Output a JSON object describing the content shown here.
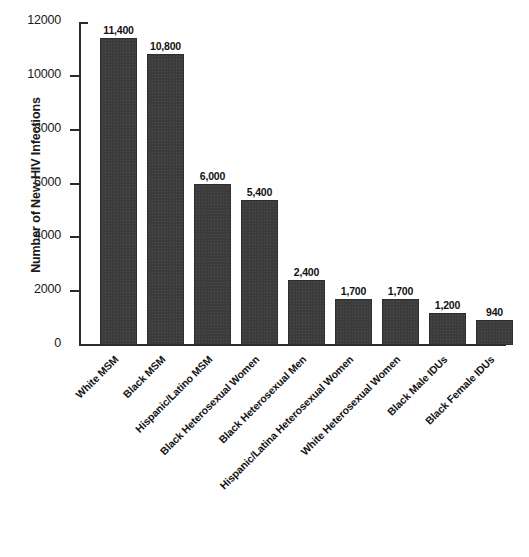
{
  "chart_data": {
    "type": "bar",
    "title": "",
    "xlabel": "",
    "ylabel": "Number of New HIV Infections",
    "ylim": [
      0,
      12000
    ],
    "grid": false,
    "legend": "none",
    "bar_color": "#3c3c3c",
    "axis_color": "#2b2b2b",
    "background_color": "#ffffff",
    "yticks": [
      0,
      2000,
      4000,
      6000,
      8000,
      10000,
      12000
    ],
    "ytick_labels": [
      "0",
      "2000",
      "4000",
      "6000",
      "8000",
      "10000",
      "12000"
    ],
    "categories": [
      "White MSM",
      "Black MSM",
      "Hispanic/Latino MSM",
      "Black Heterosexual Women",
      "Black Heterosexual Men",
      "Hispanic/Latina Heterosexual Women",
      "White Heterosexual Women",
      "Black Male IDUs",
      "Black Female IDUs"
    ],
    "values": [
      11400,
      10800,
      6000,
      5400,
      2400,
      1700,
      1700,
      1200,
      940
    ],
    "data_labels": [
      "11,400",
      "10,800",
      "6,000",
      "5,400",
      "2,400",
      "1,700",
      "1,700",
      "1,200",
      "940"
    ]
  }
}
